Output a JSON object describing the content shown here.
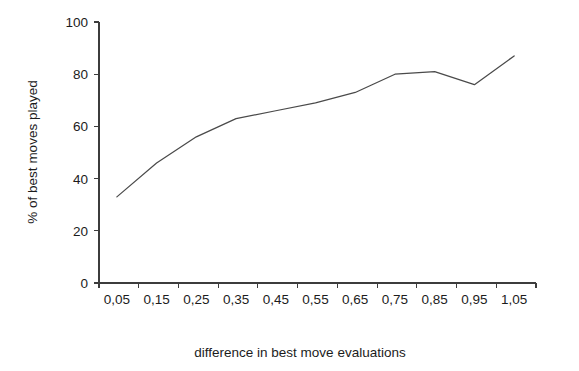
{
  "chart_data": {
    "type": "line",
    "title": "",
    "subtitle": "",
    "xlabel": "difference in best move evaluations",
    "ylabel": "% of best moves played",
    "categories": [
      "0,05",
      "0,15",
      "0,25",
      "0,35",
      "0,45",
      "0,55",
      "0,65",
      "0,75",
      "0,85",
      "0,95",
      "1,05"
    ],
    "x": [
      0.05,
      0.15,
      0.25,
      0.35,
      0.45,
      0.55,
      0.65,
      0.75,
      0.85,
      0.95,
      1.05
    ],
    "values": [
      33,
      46,
      56,
      63,
      66,
      69,
      73,
      80,
      81,
      76,
      87
    ],
    "series": [
      {
        "name": "% of best moves played",
        "values": [
          33,
          46,
          56,
          63,
          66,
          69,
          73,
          80,
          81,
          76,
          87
        ],
        "color": "#4a4a4a"
      }
    ],
    "ylim": [
      0,
      100
    ],
    "ytick_labels": [
      "0",
      "20",
      "40",
      "60",
      "80",
      "100"
    ],
    "ytick_values": [
      0,
      20,
      40,
      60,
      80,
      100
    ],
    "xtick_labels": [
      "0,05",
      "0,15",
      "0,25",
      "0,35",
      "0,45",
      "0,55",
      "0,65",
      "0,75",
      "0,85",
      "0,95",
      "1,05"
    ],
    "grid": false,
    "legend": "none",
    "background_color": "#ffffff",
    "axis_color": "#3c3c3c",
    "text_color": "#1c1c1c"
  }
}
